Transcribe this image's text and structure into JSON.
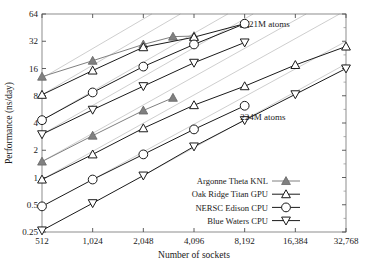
{
  "chart_data": {
    "type": "line",
    "title": "",
    "xlabel": "Number of sockets",
    "ylabel": "Performance (ns/day)",
    "xscale": "log2",
    "yscale": "log2",
    "xlim": [
      512,
      32768
    ],
    "ylim": [
      0.25,
      64
    ],
    "grid": false,
    "legend_position": "lower-right",
    "x_ticklabels": [
      "512",
      "1,024",
      "2,048",
      "4,096",
      "8,192",
      "16,384",
      "32,768"
    ],
    "x_tickvalues": [
      512,
      1024,
      2048,
      4096,
      8192,
      16384,
      32768
    ],
    "y_ticklabels": [
      "0.25",
      "0.5",
      "1",
      "2",
      "4",
      "8",
      "16",
      "32",
      "64"
    ],
    "y_tickvalues": [
      0.25,
      0.5,
      1,
      2,
      4,
      8,
      16,
      32,
      64
    ],
    "annotations": [
      {
        "text": "21M atoms",
        "x": 11500,
        "y": 46
      },
      {
        "text": "224M atoms",
        "x": 10500,
        "y": 4.3
      }
    ],
    "series": [
      {
        "name": "Argonne Theta KNL",
        "dataset": "21M atoms",
        "marker": "triangle-up-filled",
        "color": "#808080",
        "x": [
          512,
          1024,
          2048,
          3072,
          4096
        ],
        "values": [
          13.0,
          19.5,
          29.5,
          36.0,
          36.5
        ]
      },
      {
        "name": "Oak Ridge Titan GPU",
        "dataset": "21M atoms",
        "marker": "triangle-up-open",
        "color": "#1a1a1a",
        "x": [
          512,
          1024,
          2048,
          4096,
          8192
        ],
        "values": [
          8.2,
          15.2,
          27.5,
          35.5,
          50.0
        ]
      },
      {
        "name": "NERSC Edison CPU",
        "dataset": "21M atoms",
        "marker": "circle-open",
        "color": "#1a1a1a",
        "x": [
          512,
          1024,
          2048,
          4096,
          8192
        ],
        "values": [
          4.3,
          8.7,
          16.8,
          29.5,
          50.0
        ]
      },
      {
        "name": "Blue Waters CPU",
        "dataset": "21M atoms",
        "marker": "triangle-down-open",
        "color": "#1a1a1a",
        "x": [
          512,
          1024,
          2048,
          4096,
          8192
        ],
        "values": [
          3.0,
          5.6,
          10.2,
          18.5,
          31.0
        ]
      },
      {
        "name": "Argonne Theta KNL",
        "dataset": "224M atoms",
        "marker": "triangle-up-filled",
        "color": "#808080",
        "x": [
          512,
          1024,
          2048,
          3072
        ],
        "values": [
          1.5,
          2.9,
          5.5,
          7.6
        ]
      },
      {
        "name": "Oak Ridge Titan GPU",
        "dataset": "224M atoms",
        "marker": "triangle-up-open",
        "color": "#1a1a1a",
        "x": [
          512,
          1024,
          2048,
          4096,
          8192,
          16384,
          32768
        ],
        "values": [
          0.95,
          1.8,
          3.5,
          6.3,
          10.2,
          17.5,
          28.0
        ]
      },
      {
        "name": "NERSC Edison CPU",
        "dataset": "224M atoms",
        "marker": "circle-open",
        "color": "#1a1a1a",
        "x": [
          512,
          1024,
          2048,
          4096,
          8192
        ],
        "values": [
          0.48,
          0.95,
          1.8,
          3.4,
          6.2
        ]
      },
      {
        "name": "Blue Waters CPU",
        "dataset": "224M atoms",
        "marker": "triangle-down-open",
        "color": "#1a1a1a",
        "x": [
          512,
          1024,
          2048,
          4096,
          8192,
          16384,
          32768
        ],
        "values": [
          0.26,
          0.52,
          1.05,
          2.2,
          4.3,
          8.3,
          16.0
        ]
      }
    ],
    "reference_lines": [
      {
        "name": "ideal-scaling-1",
        "color": "#c8c8c8",
        "x": [
          512,
          2300
        ],
        "values": [
          12.5,
          64
        ]
      },
      {
        "name": "ideal-scaling-2",
        "color": "#c8c8c8",
        "x": [
          512,
          3400
        ],
        "values": [
          8.2,
          64
        ]
      },
      {
        "name": "ideal-scaling-3",
        "color": "#c8c8c8",
        "x": [
          512,
          6500
        ],
        "values": [
          4.3,
          64
        ]
      },
      {
        "name": "ideal-scaling-4",
        "color": "#c8c8c8",
        "x": [
          512,
          9200
        ],
        "values": [
          3.0,
          64
        ]
      },
      {
        "name": "ideal-scaling-5",
        "color": "#c8c8c8",
        "x": [
          512,
          19000
        ],
        "values": [
          1.5,
          64
        ]
      },
      {
        "name": "ideal-scaling-6",
        "color": "#c8c8c8",
        "x": [
          512,
          30000
        ],
        "values": [
          0.95,
          64
        ]
      },
      {
        "name": "ideal-scaling-7",
        "color": "#c8c8c8",
        "x": [
          1024,
          32768
        ],
        "values": [
          0.95,
          32
        ]
      },
      {
        "name": "ideal-scaling-8",
        "color": "#c8c8c8",
        "x": [
          2048,
          32768
        ],
        "values": [
          1.05,
          18
        ]
      }
    ],
    "legend": [
      {
        "label": "Argonne Theta KNL",
        "marker": "triangle-up-filled",
        "color": "#808080"
      },
      {
        "label": "Oak Ridge Titan GPU",
        "marker": "triangle-up-open",
        "color": "#1a1a1a"
      },
      {
        "label": "NERSC Edison CPU",
        "marker": "circle-open",
        "color": "#1a1a1a"
      },
      {
        "label": "Blue Waters CPU",
        "marker": "triangle-down-open",
        "color": "#1a1a1a"
      }
    ]
  }
}
